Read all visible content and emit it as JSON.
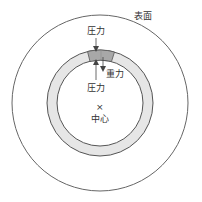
{
  "diagram": {
    "labels": {
      "surface": "表面",
      "pressure_top": "圧力",
      "gravity": "重力",
      "pressure_bottom": "圧力",
      "center_mark": "×",
      "center": "中心"
    },
    "colors": {
      "stroke": "#555555",
      "ring_fill": "#e6e6e6",
      "segment_fill": "#a8a8a8",
      "text": "#333333"
    }
  }
}
